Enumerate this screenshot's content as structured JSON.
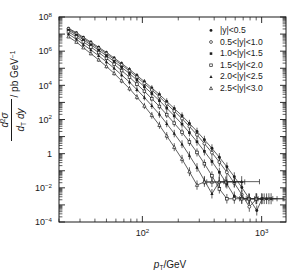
{
  "chart_data": {
    "type": "scatter",
    "title": "",
    "xlabel": "p_T/GeV",
    "ylabel": "d^2 sigma / (dp_T dy) / pb GeV^-1",
    "xscale": "log",
    "yscale": "log",
    "xlim": [
      20,
      1600
    ],
    "ylim": [
      0.0001,
      100000000.0
    ],
    "grid": false,
    "legend_position": "top-right",
    "xticks_major": [
      100,
      1000
    ],
    "xticklabels": [
      "10²",
      "10³"
    ],
    "yticks_major": [
      100000000.0,
      1000000.0,
      10000.0,
      100.0,
      1,
      0.01,
      0.0001
    ],
    "yticklabels": [
      "10⁸",
      "10⁶",
      "10⁴",
      "10²",
      "1",
      "10⁻²",
      "10⁻⁴"
    ],
    "series": [
      {
        "name": "|y|<0.5",
        "marker": "filled-circle",
        "x": [
          24,
          28,
          32,
          37,
          43,
          50,
          58,
          67,
          78,
          90,
          104,
          120,
          139,
          160,
          185,
          215,
          248,
          287,
          331,
          383,
          442,
          511,
          590,
          682,
          788,
          910,
          1010,
          1100,
          1200
        ],
        "y": [
          22000000.0,
          12000000.0,
          6500000.0,
          3400000.0,
          1700000.0,
          840000.0,
          400000.0,
          190000.0,
          86000.0,
          38000.0,
          16500.0,
          7000.0,
          2900.0,
          1150.0,
          440,
          165,
          59,
          20,
          6.6,
          2.05,
          0.61,
          0.17,
          0.044,
          0.0105,
          0.0023,
          0.00047,
          0.0023,
          0.0023,
          0.0023
        ]
      },
      {
        "name": "0.5<|y|<1.0",
        "marker": "open-circle",
        "x": [
          24,
          28,
          32,
          37,
          43,
          50,
          58,
          67,
          78,
          90,
          104,
          120,
          139,
          160,
          185,
          215,
          248,
          287,
          331,
          383,
          442,
          511,
          590,
          682,
          788,
          910,
          1050,
          1150
        ],
        "y": [
          20000000.0,
          10500000.0,
          5600000.0,
          2900000.0,
          1450000.0,
          700000.0,
          330000.0,
          155000.0,
          69000.0,
          30000.0,
          12700.0,
          5300.0,
          2150.0,
          830,
          310,
          113,
          39,
          12.6,
          3.9,
          1.15,
          0.32,
          0.082,
          0.019,
          0.004,
          0.00078,
          0.0023,
          0.0023,
          0.0023
        ]
      },
      {
        "name": "1.0<|y|<1.5",
        "marker": "filled-square",
        "x": [
          24,
          28,
          32,
          37,
          43,
          50,
          58,
          67,
          78,
          90,
          104,
          120,
          139,
          160,
          185,
          215,
          248,
          287,
          331,
          383,
          442,
          511,
          590,
          682,
          788,
          900,
          1000
        ],
        "y": [
          17000000.0,
          8800000.0,
          4600000.0,
          2350000.0,
          1150000.0,
          540000.0,
          250000.0,
          113000.0,
          49000.0,
          20500.0,
          8300.0,
          3300.0,
          1270.0,
          465,
          163,
          54,
          17,
          5.0,
          1.37,
          0.35,
          0.082,
          0.017,
          0.0032,
          0.0023,
          0.0023,
          0.0023,
          0.0023
        ]
      },
      {
        "name": "1.5<|y|<2.0",
        "marker": "open-square",
        "x": [
          24,
          28,
          32,
          37,
          43,
          50,
          58,
          67,
          78,
          90,
          104,
          120,
          139,
          160,
          185,
          215,
          248,
          287,
          331,
          383,
          442,
          511,
          590,
          680,
          780,
          900
        ],
        "y": [
          13500000.0,
          6900000.0,
          3500000.0,
          1750000.0,
          830000.0,
          380000.0,
          170000.0,
          73000.0,
          30000.0,
          11800.0,
          4500.0,
          1650.0,
          580,
          193,
          61,
          17.8,
          4.8,
          1.18,
          0.26,
          0.051,
          0.0086,
          0.0023,
          0.0023,
          0.0023,
          0.0023,
          0.0023
        ]
      },
      {
        "name": "2.0<|y|<2.5",
        "marker": "filled-triangle",
        "x": [
          24,
          28,
          32,
          37,
          43,
          50,
          58,
          67,
          78,
          90,
          104,
          120,
          139,
          160,
          185,
          215,
          248,
          287,
          331,
          383,
          442,
          510,
          590,
          680
        ],
        "y": [
          10000000.0,
          5000000.0,
          2450000.0,
          1180000.0,
          540000.0,
          235000.0,
          100000.0,
          40000.0,
          15500.0,
          5600.0,
          1950.0,
          640,
          200,
          57,
          15,
          3.6,
          0.78,
          0.155,
          0.027,
          0.0045,
          0.023,
          0.023,
          0.023,
          0.023
        ]
      },
      {
        "name": "2.5<|y|<3.0",
        "marker": "open-triangle",
        "x": [
          24,
          28,
          32,
          37,
          43,
          50,
          58,
          67,
          78,
          90,
          104,
          120,
          139,
          160,
          185,
          215,
          248,
          287,
          331,
          383,
          440,
          500
        ],
        "y": [
          7000000.0,
          3400000.0,
          1600000.0,
          720000.0,
          310000.0,
          127000.0,
          50000.0,
          18500.0,
          6400.0,
          2050.0,
          620,
          175,
          46,
          11,
          2.4,
          0.48,
          0.088,
          0.0145,
          0.022,
          0.022,
          0.022,
          0.022
        ]
      }
    ]
  },
  "axes": {
    "xlabel_main": "p",
    "xlabel_sub": "T",
    "xlabel_tail": "/GeV",
    "ylabel_num_d": "d",
    "ylabel_num_exp": "2",
    "ylabel_num_sigma": "σ",
    "ylabel_den_d1": "d",
    "ylabel_den_sub": "T",
    "ylabel_den_d2": " d",
    "ylabel_den_y": "y",
    "ylabel_units": "/ pb GeV",
    "ylabel_units_exp": "−1",
    "xticklabels": [
      {
        "base": "10",
        "exp": "2"
      },
      {
        "base": "10",
        "exp": "3"
      }
    ],
    "yticklabels": [
      {
        "base": "10",
        "exp": "8"
      },
      {
        "base": "10",
        "exp": "6"
      },
      {
        "base": "10",
        "exp": "4"
      },
      {
        "base": "10",
        "exp": "2"
      },
      {
        "base": "1",
        "exp": ""
      },
      {
        "base": "10",
        "exp": "−2"
      },
      {
        "base": "10",
        "exp": "−4"
      }
    ]
  },
  "legend": {
    "items": [
      {
        "label": "|y|<0.5",
        "marker": "filled-circle"
      },
      {
        "label": "0.5<|y|<1.0",
        "marker": "open-circle"
      },
      {
        "label": "1.0<|y|<1.5",
        "marker": "filled-square"
      },
      {
        "label": "1.5<|y|<2.0",
        "marker": "open-square"
      },
      {
        "label": "2.0<|y|<2.5",
        "marker": "filled-triangle"
      },
      {
        "label": "2.5<|y|<3.0",
        "marker": "open-triangle"
      }
    ]
  },
  "colors": {
    "ink": "#1a1a1a",
    "data": "#2b2b2b",
    "background": "#ffffff"
  }
}
